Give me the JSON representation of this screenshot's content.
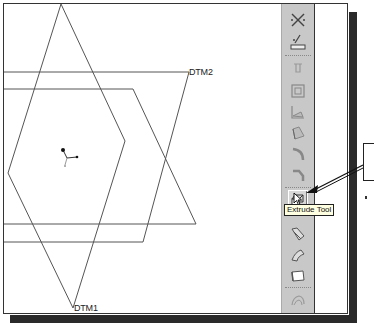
{
  "viewport": {
    "datums": [
      {
        "name": "DTM1",
        "label": "DTM1"
      },
      {
        "name": "DTM2",
        "label": "DTM2"
      }
    ],
    "coordinate_system": "csys-icon"
  },
  "toolbar": {
    "tools": [
      {
        "name": "datum-plane-tool",
        "icon": "datum-plane-icon"
      },
      {
        "name": "sketch-tool",
        "icon": "sketch-icon"
      },
      {
        "name": "hole-tool",
        "icon": "hole-icon"
      },
      {
        "name": "shell-tool",
        "icon": "shell-icon"
      },
      {
        "name": "rib-tool",
        "icon": "rib-icon"
      },
      {
        "name": "draft-tool",
        "icon": "draft-icon"
      },
      {
        "name": "round-tool",
        "icon": "round-icon"
      },
      {
        "name": "chamfer-tool",
        "icon": "chamfer-icon"
      },
      {
        "name": "extrude-tool",
        "icon": "extrude-icon",
        "active": true
      },
      {
        "name": "revolve-tool",
        "icon": "revolve-icon"
      },
      {
        "name": "sweep-tool",
        "icon": "sweep-icon"
      },
      {
        "name": "blend-tool",
        "icon": "blend-icon"
      },
      {
        "name": "style-tool",
        "icon": "style-icon"
      }
    ]
  },
  "tooltip": {
    "text": "Extrude Tool"
  },
  "colors": {
    "toolbar_bg": "#c8c8c8",
    "shadow": "#2a2a2a",
    "tooltip_bg": "#ffffe1",
    "line": "#444444"
  }
}
